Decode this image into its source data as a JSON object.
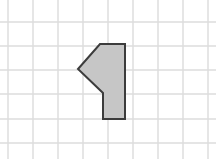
{
  "canvas": {
    "width": 216,
    "height": 159,
    "background_color": "#ffffff",
    "label": "grid-worksheet-canvas"
  },
  "grid": {
    "name": "background-grid",
    "line_color": "#dcdcdc",
    "line_width": 1.4,
    "cell_size": 24.7,
    "vertical_line_x": [
      8,
      33,
      58,
      83,
      108,
      133,
      158,
      183,
      208
    ],
    "horizontal_line_y": [
      22,
      46,
      70,
      94,
      119,
      143
    ],
    "columns": 8,
    "rows": 5
  },
  "shape": {
    "name": "gray-pentagon-arrow",
    "description": "Shaded pentagon resembling a left-pointing flag or arrow",
    "fill_color": "#c6c6c6",
    "stroke_color": "#3c3c3c",
    "stroke_width": 2,
    "vertex_count": 6,
    "points": "100,44 125,44 125,119 103,119 103,93 78,69",
    "vertices": [
      {
        "label": "top-left",
        "x": 100,
        "y": 44
      },
      {
        "label": "top-right",
        "x": 125,
        "y": 44
      },
      {
        "label": "bottom-right",
        "x": 125,
        "y": 119
      },
      {
        "label": "bottom-left",
        "x": 103,
        "y": 119
      },
      {
        "label": "notch",
        "x": 103,
        "y": 93
      },
      {
        "label": "left-point",
        "x": 78,
        "y": 69
      }
    ]
  }
}
